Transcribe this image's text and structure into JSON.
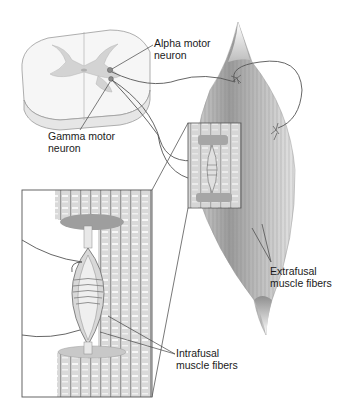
{
  "figure": {
    "type": "anatomical illustration"
  },
  "labels": {
    "alpha_motor_neuron": {
      "line1": "Alpha motor",
      "line2": "neuron"
    },
    "gamma_motor_neuron": {
      "line1": "Gamma motor",
      "line2": "neuron"
    },
    "extrafusal": {
      "line1": "Extrafusal",
      "line2": "muscle fibers"
    },
    "intrafusal": {
      "line1": "Intrafusal",
      "line2": "muscle fibers"
    }
  },
  "colors": {
    "background": "#ffffff",
    "outline": "#555555",
    "gray_matter": "#d8d8d8",
    "white_matter": "#f4f4f4",
    "muscle_dark": "#8a8a8a",
    "muscle_light": "#e2e2e2",
    "text": "#1a1a1a"
  }
}
